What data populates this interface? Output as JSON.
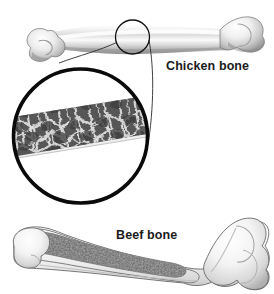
{
  "figure": {
    "background_color": "#ffffff"
  },
  "labels": {
    "chicken_bone": "Chicken bone",
    "beef_bone": "Beef bone"
  },
  "specimens": [
    {
      "id": "chicken-bone",
      "label": "Chicken bone",
      "description": "Whole chicken long bone (femur) shown intact, light grey shaded line drawing, oriented horizontally near the top of the figure."
    },
    {
      "id": "beef-bone",
      "label": "Beef bone",
      "description": "Whole beef long bone shown in longitudinal cutaway revealing the darker speckled marrow cavity inside the pale cortical wall."
    }
  ],
  "callout": {
    "id": "magnifier-callout",
    "source_marker": "small-circle-on-chicken-bone",
    "target": "large-magnified-circle",
    "content_description": "Magnified cross-section of the chicken bone shaft showing thin pale cortical walls enclosing a dark trabecular (spongy) bone network.",
    "outline_color": "#000000"
  },
  "colors": {
    "outline": "#000000",
    "bone_light": "#f2f2f2",
    "bone_mid": "#c9c9c9",
    "bone_shadow": "#8e8e8e",
    "marrow": "#9a9a9a",
    "trabecular_dark": "#4d4d4d",
    "trabecular_light": "#e3e3e3",
    "text": "#1b1b1b"
  }
}
